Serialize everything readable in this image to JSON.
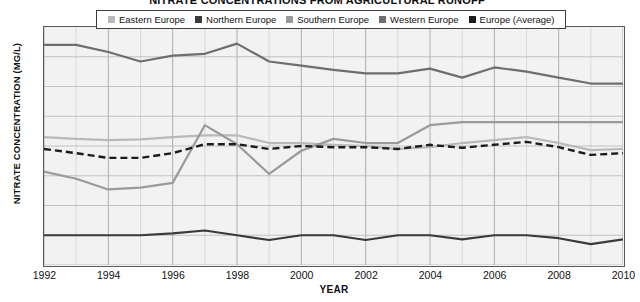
{
  "chart_data": {
    "type": "line",
    "title": "NITRATE CONCENTRATIONS FROM AGRICULTURAL RUNOFF",
    "xlabel": "YEAR",
    "ylabel": "NITRATE CONCENTRATION (MG/L)",
    "xlim": [
      1992,
      2010
    ],
    "ylim": [
      0,
      4.0
    ],
    "ytick_labels": [
      "4.0",
      "3.5",
      "3.0",
      "2.5",
      "2.0",
      "1.5",
      "1.0",
      "0.5",
      "0"
    ],
    "ytick_values": [
      4.0,
      3.5,
      3.0,
      2.5,
      2.0,
      1.5,
      1.0,
      0.5,
      0
    ],
    "xtick_labels": [
      "1992",
      "1994",
      "1996",
      "1998",
      "2000",
      "2002",
      "2004",
      "2006",
      "2008",
      "2010"
    ],
    "xtick_values": [
      1992,
      1994,
      1996,
      1998,
      2000,
      2002,
      2004,
      2006,
      2008,
      2010
    ],
    "x": [
      1992,
      1993,
      1994,
      1995,
      1996,
      1997,
      1998,
      1999,
      2000,
      2001,
      2002,
      2003,
      2004,
      2005,
      2006,
      2007,
      2008,
      2009,
      2010
    ],
    "grid": "both-minor-yearly",
    "legend_position": "top-center",
    "series": [
      {
        "name": "Eastern Europe",
        "color": "#b9b9b9",
        "style": "solid",
        "values": [
          2.15,
          2.12,
          2.1,
          2.11,
          2.15,
          2.18,
          2.18,
          2.05,
          2.05,
          2.02,
          2.0,
          1.95,
          1.98,
          2.05,
          2.1,
          2.15,
          2.05,
          1.93,
          1.95
        ]
      },
      {
        "name": "Northern Europe",
        "color": "#3a3a3c",
        "style": "solid",
        "values": [
          0.5,
          0.5,
          0.5,
          0.5,
          0.53,
          0.58,
          0.5,
          0.42,
          0.5,
          0.5,
          0.42,
          0.5,
          0.5,
          0.43,
          0.5,
          0.5,
          0.45,
          0.35,
          0.43
        ]
      },
      {
        "name": "Southern Europe",
        "color": "#9a9a9c",
        "style": "solid",
        "values": [
          1.57,
          1.45,
          1.27,
          1.3,
          1.38,
          2.35,
          2.03,
          1.53,
          1.92,
          2.12,
          2.05,
          2.05,
          2.35,
          2.4,
          2.4,
          2.4,
          2.4,
          2.4,
          2.4
        ]
      },
      {
        "name": "Western Europe",
        "color": "#6e6e70",
        "style": "solid",
        "values": [
          3.7,
          3.7,
          3.58,
          3.42,
          3.52,
          3.55,
          3.72,
          3.42,
          3.35,
          3.28,
          3.22,
          3.22,
          3.3,
          3.15,
          3.32,
          3.25,
          3.15,
          3.05,
          3.05
        ]
      },
      {
        "name": "Europe (Average)",
        "color": "#1c1c1e",
        "style": "dashed",
        "values": [
          1.95,
          1.88,
          1.8,
          1.8,
          1.88,
          2.03,
          2.03,
          1.95,
          2.0,
          1.98,
          1.98,
          1.95,
          2.02,
          1.97,
          2.02,
          2.07,
          1.98,
          1.85,
          1.88
        ]
      }
    ]
  },
  "legend": {
    "items": [
      {
        "label": "Eastern Europe",
        "color": "#b9b9b9"
      },
      {
        "label": "Northern Europe",
        "color": "#3a3a3c"
      },
      {
        "label": "Southern Europe",
        "color": "#9a9a9c"
      },
      {
        "label": "Western Europe",
        "color": "#6e6e70"
      },
      {
        "label": "Europe (Average)",
        "color": "#1c1c1e"
      }
    ]
  }
}
